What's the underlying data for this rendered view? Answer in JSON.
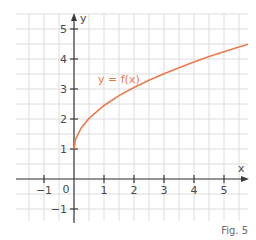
{
  "chart_data": {
    "type": "line",
    "title": "",
    "xlabel": "x",
    "ylabel": "y",
    "xlim": [
      -2,
      5.8
    ],
    "ylim": [
      -1.4,
      5.5
    ],
    "grid": true,
    "grid_step": 0.5,
    "x_ticks": [
      -1,
      1,
      2,
      3,
      4,
      5
    ],
    "x_tick_labels": [
      "−1",
      "1",
      "2",
      "3",
      "4",
      "5"
    ],
    "y_ticks": [
      -1,
      1,
      2,
      3,
      4,
      5
    ],
    "y_tick_labels": [
      "−1",
      "1",
      "2",
      "3",
      "4",
      "5"
    ],
    "origin_label": "0",
    "series": [
      {
        "name": "y = f(x)",
        "color": "#ec7a4f",
        "x": [
          0,
          0.05,
          0.25,
          0.5,
          1,
          1.5,
          2,
          2.5,
          3,
          3.5,
          4,
          4.5,
          5,
          5.5,
          5.8
        ],
        "y": [
          1,
          1.32,
          1.72,
          2.02,
          2.45,
          2.78,
          3.05,
          3.29,
          3.51,
          3.71,
          3.9,
          4.08,
          4.24,
          4.4,
          4.49
        ]
      }
    ],
    "annotations": [
      {
        "text": "y = f(x)",
        "x": 0.8,
        "y": 3.2,
        "color": "#ec7a4f"
      }
    ]
  },
  "caption": "Fig. 5",
  "colors": {
    "curve": "#ec7a4f",
    "grid": "#dcdcdc",
    "axis": "#3a3a3a"
  }
}
